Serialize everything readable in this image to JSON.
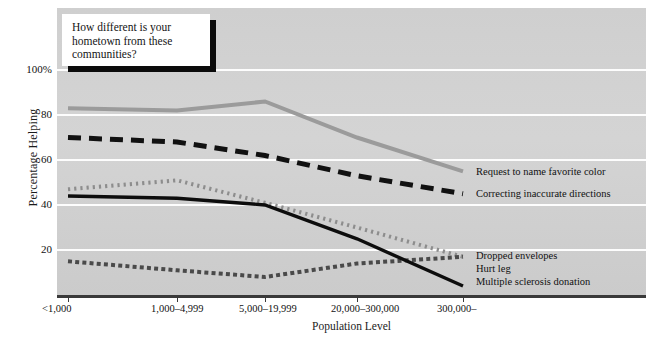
{
  "callout": {
    "text": "How different is your hometown from these communities?"
  },
  "axes": {
    "ylabel": "Percentage Helping",
    "xlabel": "Population Level",
    "yticks": [
      "100%",
      "80",
      "60",
      "40",
      "20"
    ],
    "ytick_values": [
      100,
      80,
      60,
      40,
      20
    ],
    "xticks": [
      "<1,000",
      "1,000–4,999",
      "5,000–19,999",
      "20,000–300,000",
      "300,000–"
    ]
  },
  "series_labels": {
    "favorite_color": "Request to name favorite color",
    "directions": "Correcting inaccurate directions",
    "envelopes": "Dropped envelopes",
    "hurt_leg": "Hurt leg",
    "ms_donation": "Multiple sclerosis donation"
  },
  "colors": {
    "panel": "#d2d2d2",
    "gridline": "#fdfdfd",
    "gray_line": "#9b9b9b",
    "dashed_black": "#111111",
    "dotted_gray": "#8d8d8d",
    "solid_black": "#0d0d0d",
    "fine_dotted": "#4a4a4a",
    "axis": "#3a3a3a"
  },
  "chart_data": {
    "type": "line",
    "title": "How different is your hometown from these communities?",
    "xlabel": "Population Level",
    "ylabel": "Percentage Helping",
    "categories": [
      "<1,000",
      "1,000–4,999",
      "5,000–19,999",
      "20,000–300,000",
      "300,000–"
    ],
    "ylim": [
      0,
      110
    ],
    "yticks": [
      20,
      40,
      60,
      80,
      100
    ],
    "grid": "horizontal",
    "legend": "right-of-line-ends",
    "series": [
      {
        "name": "Request to name favorite color",
        "style": "solid-thick-gray",
        "color": "#9b9b9b",
        "values": [
          83,
          82,
          86,
          70,
          55
        ]
      },
      {
        "name": "Correcting inaccurate directions",
        "style": "dashed-black",
        "color": "#111111",
        "values": [
          70,
          68,
          62,
          53,
          45
        ]
      },
      {
        "name": "Dropped envelopes",
        "style": "dotted-gray",
        "color": "#8d8d8d",
        "values": [
          47,
          51,
          41,
          30,
          17
        ]
      },
      {
        "name": "Hurt leg",
        "style": "fine-dotted-dark",
        "color": "#4a4a4a",
        "values": [
          15,
          11,
          8,
          14,
          17
        ]
      },
      {
        "name": "Multiple sclerosis donation",
        "style": "solid-black",
        "color": "#0d0d0d",
        "values": [
          44,
          43,
          40,
          25,
          4
        ]
      }
    ]
  }
}
